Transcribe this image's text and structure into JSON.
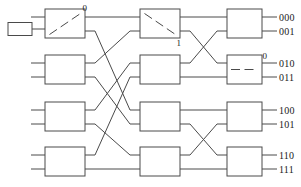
{
  "diagram": {
    "stroke_color": "#4a4a4a",
    "text_color": "#1a1a1a",
    "source_label": "",
    "switch_labels": [
      {
        "id": "s0-0-top",
        "text": "0"
      },
      {
        "id": "s1-0-bottom",
        "text": "1"
      },
      {
        "id": "s2-1-top",
        "text": "0"
      }
    ],
    "outputs": [
      {
        "id": "out-000",
        "text": "000"
      },
      {
        "id": "out-001",
        "text": "001"
      },
      {
        "id": "out-010",
        "text": "010"
      },
      {
        "id": "out-011",
        "text": "011"
      },
      {
        "id": "out-100",
        "text": "100"
      },
      {
        "id": "out-101",
        "text": "101"
      },
      {
        "id": "out-110",
        "text": "110"
      },
      {
        "id": "out-111",
        "text": "111"
      }
    ],
    "stages": [
      {
        "name": "stage-1",
        "boxes": [
          "sw-1-0",
          "sw-1-1",
          "sw-1-2",
          "sw-1-3"
        ]
      },
      {
        "name": "stage-2",
        "boxes": [
          "sw-2-0",
          "sw-2-1",
          "sw-2-2",
          "sw-2-3"
        ]
      },
      {
        "name": "stage-3",
        "boxes": [
          "sw-3-0",
          "sw-3-1",
          "sw-3-2",
          "sw-3-3"
        ]
      }
    ]
  }
}
